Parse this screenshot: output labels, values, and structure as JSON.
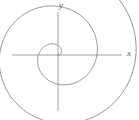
{
  "figure": {
    "background_color": "#ffffff",
    "curve_color": "#7d7d7d",
    "axis_color": "#8c8c8c",
    "label_color": "#5a5a5a",
    "width": 139,
    "height": 120
  },
  "axes": {
    "x_label": "x",
    "y_label": "y",
    "origin": {
      "x": 58,
      "y": 55
    },
    "x_axis": {
      "x1": 12,
      "y1": 55,
      "x2": 122,
      "y2": 55
    },
    "y_axis": {
      "x1": 58,
      "y1": 12,
      "x2": 58,
      "y2": 111
    }
  },
  "chart_data": {
    "type": "line",
    "xlabel": "x",
    "ylabel": "y",
    "grid": false,
    "legend": null,
    "curve_name": "r = aθ",
    "polar": {
      "equation": "r = a*theta",
      "a_pixels_per_radian": 6.2,
      "theta_start_rad": 0.0,
      "theta_end_rad": 17.2,
      "theta_start_deg": 0,
      "theta_end_deg": 985,
      "turns": 2.74,
      "direction": "counterclockwise",
      "start_angle_deg": 0
    },
    "axis_crossings_pixels": {
      "positive_x": [
        62,
        90,
        112
      ],
      "negative_x": [
        38,
        15
      ],
      "positive_y": [
        48,
        14
      ],
      "negative_y": [
        72,
        102
      ]
    },
    "x": [
      58.0,
      59.3,
      60.5,
      61.3,
      61.6,
      61.3,
      60.4,
      59.0,
      57.2,
      55.0,
      52.8,
      50.6,
      48.7,
      47.3,
      46.6,
      46.6,
      47.3,
      48.9,
      51.1,
      53.9,
      57.2,
      60.8,
      64.4,
      67.9,
      70.9,
      73.3,
      74.8,
      75.3,
      74.7,
      73.0,
      70.3,
      66.7,
      62.3,
      57.4,
      52.2,
      47.0,
      42.0,
      37.6,
      34.0,
      31.4,
      30.0,
      29.9,
      31.2,
      33.8,
      37.7,
      42.6,
      48.4,
      54.8,
      61.4,
      68.1,
      74.4,
      80.0,
      84.7,
      88.2,
      90.4,
      91.1,
      90.2,
      87.8,
      84.0,
      78.8,
      72.5,
      65.3,
      57.5,
      49.5,
      41.6,
      34.2,
      27.5,
      22.0,
      17.8,
      15.2,
      14.3,
      15.2,
      18.0,
      22.6,
      28.8,
      36.6,
      45.6,
      55.5,
      66.0,
      76.6,
      87.0,
      96.7,
      105.3,
      112.3
    ],
    "y": [
      55.0,
      54.8,
      54.1,
      53.0,
      51.6,
      50.0,
      48.4,
      46.9,
      45.7,
      44.9,
      44.6,
      44.8,
      45.6,
      47.0,
      48.8,
      51.1,
      53.7,
      56.5,
      59.4,
      62.2,
      64.8,
      67.0,
      68.6,
      69.5,
      69.6,
      68.9,
      67.3,
      64.9,
      61.7,
      57.8,
      53.4,
      48.6,
      43.6,
      38.6,
      33.8,
      29.5,
      25.8,
      23.0,
      21.1,
      20.4,
      20.9,
      22.6,
      25.5,
      29.6,
      34.8,
      40.9,
      47.8,
      55.2,
      63.0,
      70.7,
      78.3,
      85.2,
      91.3,
      96.2,
      99.8,
      101.8,
      102.1,
      100.6,
      97.3,
      92.1,
      85.3,
      76.9,
      67.1,
      56.2,
      44.5,
      32.3,
      19.9,
      7.7,
      -4.1,
      -15.1,
      -25.1,
      -33.7,
      -40.6,
      -45.6,
      -48.3,
      -48.7,
      -46.5,
      -41.6,
      -34.0,
      -23.7,
      -10.6,
      5.1,
      23.4,
      40.2
    ]
  }
}
